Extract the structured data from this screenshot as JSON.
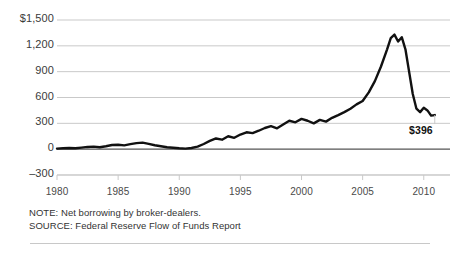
{
  "chart_data": {
    "type": "line",
    "title": "",
    "subtitle": "",
    "xlabel": "",
    "ylabel": "",
    "grid": true,
    "legend": "none",
    "xlim": [
      1980,
      2011
    ],
    "ylim": [
      -300,
      1500
    ],
    "y_ticks": [
      {
        "value": 1500,
        "label": "$1,500"
      },
      {
        "value": 1200,
        "label": "1,200"
      },
      {
        "value": 900,
        "label": "900"
      },
      {
        "value": 600,
        "label": "600"
      },
      {
        "value": 300,
        "label": "300"
      },
      {
        "value": 0,
        "label": "0"
      },
      {
        "value": -300,
        "label": "–300"
      }
    ],
    "x_ticks": [
      {
        "value": 1980,
        "label": "1980"
      },
      {
        "value": 1985,
        "label": "1985"
      },
      {
        "value": 1990,
        "label": "1990"
      },
      {
        "value": 1995,
        "label": "1995"
      },
      {
        "value": 2000,
        "label": "2000"
      },
      {
        "value": 2005,
        "label": "2005"
      },
      {
        "value": 2010,
        "label": "2010"
      }
    ],
    "series": [
      {
        "name": "Net borrowing by broker-dealers",
        "color": "#111111",
        "x": [
          1980.0,
          1980.5,
          1981.0,
          1981.5,
          1982.0,
          1982.5,
          1983.0,
          1983.5,
          1984.0,
          1984.5,
          1985.0,
          1985.5,
          1986.0,
          1986.5,
          1987.0,
          1987.5,
          1988.0,
          1988.5,
          1989.0,
          1989.5,
          1990.0,
          1990.5,
          1991.0,
          1991.5,
          1992.0,
          1992.5,
          1993.0,
          1993.5,
          1994.0,
          1994.5,
          1995.0,
          1995.5,
          1996.0,
          1996.5,
          1997.0,
          1997.5,
          1998.0,
          1998.5,
          1999.0,
          1999.5,
          2000.0,
          2000.5,
          2001.0,
          2001.5,
          2002.0,
          2002.5,
          2003.0,
          2003.5,
          2004.0,
          2004.5,
          2005.0,
          2005.5,
          2006.0,
          2006.5,
          2007.0,
          2007.3,
          2007.6,
          2007.9,
          2008.2,
          2008.5,
          2008.8,
          2009.1,
          2009.4,
          2009.7,
          2010.0,
          2010.3,
          2010.6,
          2010.9
        ],
        "y": [
          6,
          10,
          14,
          10,
          18,
          26,
          30,
          22,
          34,
          48,
          52,
          44,
          58,
          70,
          76,
          62,
          46,
          34,
          22,
          16,
          10,
          6,
          14,
          30,
          60,
          96,
          124,
          110,
          150,
          132,
          170,
          196,
          186,
          214,
          246,
          268,
          242,
          286,
          330,
          312,
          352,
          330,
          300,
          340,
          320,
          364,
          396,
          430,
          470,
          520,
          560,
          660,
          790,
          960,
          1160,
          1290,
          1330,
          1250,
          1300,
          1160,
          900,
          640,
          470,
          430,
          480,
          450,
          390,
          396
        ]
      }
    ],
    "annotations": [
      {
        "name": "end-value-label",
        "text": "$396",
        "value": 396,
        "x": 2010.9
      }
    ]
  },
  "footnotes": {
    "note": "NOTE: Net borrowing by broker-dealers.",
    "source": "SOURCE: Federal Reserve Flow of Funds Report"
  },
  "colors": {
    "line": "#111111",
    "grid": "#c9c9c9",
    "zero_axis": "#555555",
    "text": "#333333",
    "background": "#ffffff"
  }
}
